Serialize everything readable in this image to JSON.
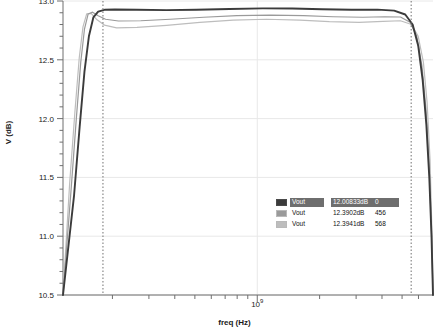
{
  "chart_data": {
    "type": "line",
    "title": "",
    "xlabel": "freq (Hz)",
    "ylabel": "V (dB)",
    "xscale": "log",
    "yscale": "linear",
    "ylim": [
      10.5,
      13.0
    ],
    "yticks": [
      10.5,
      11.0,
      11.5,
      12.0,
      12.5,
      13.0
    ],
    "ytick_labels": [
      "10.5",
      "11.0",
      "11.5",
      "12.0",
      "12.5",
      "13.0"
    ],
    "xticks_major_label": "10",
    "xticks_major_exponent": "9",
    "grid": true,
    "legend_position": "inside-right",
    "markers": {
      "type": "vertical-dashed",
      "count": 2,
      "color": "#707070"
    },
    "series": [
      {
        "name": "Vout",
        "color": "#3b3b3b",
        "value_label": "12.00833dB",
        "index_label": "0",
        "selected": true,
        "passband_db": 12.93,
        "points": [
          [
            0.0,
            10.5
          ],
          [
            0.03,
            11.35
          ],
          [
            0.045,
            11.93
          ],
          [
            0.058,
            12.4
          ],
          [
            0.07,
            12.7
          ],
          [
            0.082,
            12.86
          ],
          [
            0.095,
            12.91
          ],
          [
            0.112,
            12.925
          ],
          [
            0.14,
            12.928
          ],
          [
            0.2,
            12.925
          ],
          [
            0.28,
            12.922
          ],
          [
            0.36,
            12.926
          ],
          [
            0.45,
            12.932
          ],
          [
            0.54,
            12.937
          ],
          [
            0.62,
            12.936
          ],
          [
            0.7,
            12.93
          ],
          [
            0.78,
            12.926
          ],
          [
            0.85,
            12.927
          ],
          [
            0.895,
            12.918
          ],
          [
            0.925,
            12.885
          ],
          [
            0.945,
            12.8
          ],
          [
            0.96,
            12.62
          ],
          [
            0.972,
            12.33
          ],
          [
            0.982,
            11.95
          ],
          [
            0.99,
            11.5
          ],
          [
            0.996,
            11.0
          ],
          [
            1.0,
            10.5
          ]
        ]
      },
      {
        "name": "Vout",
        "color": "#9a9a9a",
        "value_label": "12.3902dB",
        "index_label": "456",
        "selected": false,
        "passband_db": 12.86,
        "points": [
          [
            0.0,
            10.5
          ],
          [
            0.022,
            11.4
          ],
          [
            0.036,
            12.0
          ],
          [
            0.048,
            12.48
          ],
          [
            0.058,
            12.76
          ],
          [
            0.068,
            12.89
          ],
          [
            0.08,
            12.905
          ],
          [
            0.095,
            12.875
          ],
          [
            0.115,
            12.845
          ],
          [
            0.15,
            12.83
          ],
          [
            0.21,
            12.832
          ],
          [
            0.29,
            12.845
          ],
          [
            0.38,
            12.862
          ],
          [
            0.47,
            12.876
          ],
          [
            0.56,
            12.88
          ],
          [
            0.65,
            12.875
          ],
          [
            0.73,
            12.866
          ],
          [
            0.81,
            12.862
          ],
          [
            0.87,
            12.866
          ],
          [
            0.912,
            12.864
          ],
          [
            0.938,
            12.82
          ],
          [
            0.956,
            12.7
          ],
          [
            0.97,
            12.45
          ],
          [
            0.981,
            12.08
          ],
          [
            0.99,
            11.58
          ],
          [
            0.996,
            11.02
          ],
          [
            1.0,
            10.5
          ]
        ]
      },
      {
        "name": "Vout",
        "color": "#bdbdbd",
        "value_label": "12.3941dB",
        "index_label": "568",
        "selected": false,
        "passband_db": 12.79,
        "points": [
          [
            0.0,
            10.5
          ],
          [
            0.018,
            11.45
          ],
          [
            0.032,
            12.05
          ],
          [
            0.044,
            12.52
          ],
          [
            0.054,
            12.78
          ],
          [
            0.064,
            12.89
          ],
          [
            0.076,
            12.895
          ],
          [
            0.092,
            12.84
          ],
          [
            0.112,
            12.795
          ],
          [
            0.145,
            12.772
          ],
          [
            0.2,
            12.775
          ],
          [
            0.28,
            12.793
          ],
          [
            0.37,
            12.818
          ],
          [
            0.46,
            12.838
          ],
          [
            0.55,
            12.845
          ],
          [
            0.64,
            12.838
          ],
          [
            0.72,
            12.825
          ],
          [
            0.8,
            12.818
          ],
          [
            0.865,
            12.826
          ],
          [
            0.912,
            12.832
          ],
          [
            0.942,
            12.8
          ],
          [
            0.96,
            12.7
          ],
          [
            0.974,
            12.48
          ],
          [
            0.984,
            12.14
          ],
          [
            0.992,
            11.65
          ],
          [
            0.997,
            11.05
          ],
          [
            1.0,
            10.5
          ]
        ]
      }
    ]
  },
  "axes": {
    "ylabel": "V (dB)",
    "xlabel": "freq (Hz)",
    "xtick_base": "10",
    "xtick_exp": "9",
    "ytick_labels": [
      "13.0",
      "12.5",
      "12.0",
      "11.5",
      "11.0",
      "10.5"
    ]
  },
  "legend": {
    "rows": [
      {
        "name": "Vout",
        "value": "12.00833dB",
        "index": "0"
      },
      {
        "name": "Vout",
        "value": "12.3902dB",
        "index": "456"
      },
      {
        "name": "Vout",
        "value": "12.3941dB",
        "index": "568"
      }
    ]
  },
  "colors": {
    "trace_1": "#3b3b3b",
    "trace_2": "#9a9a9a",
    "trace_3": "#bdbdbd",
    "axis": "#6f6f6f",
    "grid": "#e8e8e8",
    "marker": "#707070",
    "legend_selected_bg": "#6e6e6e"
  }
}
